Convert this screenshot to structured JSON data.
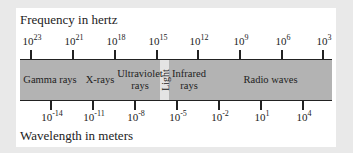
{
  "diagram": {
    "title_top": "Frequency in hertz",
    "title_bottom": "Wavelength in meters",
    "colors": {
      "band": "#b3b3b3",
      "light_strip": "#e4e4e4",
      "panel": "#ffffff",
      "background": "#e9e9e9"
    },
    "frequency_ticks": [
      {
        "base": "10",
        "exp": "23",
        "x": 30
      },
      {
        "base": "10",
        "exp": "21",
        "x": 72
      },
      {
        "base": "10",
        "exp": "18",
        "x": 114
      },
      {
        "base": "10",
        "exp": "15",
        "x": 156
      },
      {
        "base": "10",
        "exp": "12",
        "x": 197
      },
      {
        "base": "10",
        "exp": "9",
        "x": 239
      },
      {
        "base": "10",
        "exp": "6",
        "x": 281
      },
      {
        "base": "10",
        "exp": "3",
        "x": 322
      }
    ],
    "wavelength_ticks": [
      {
        "base": "10",
        "exp": "-14",
        "x": 50
      },
      {
        "base": "10",
        "exp": "-11",
        "x": 92
      },
      {
        "base": "10",
        "exp": "-8",
        "x": 134
      },
      {
        "base": "10",
        "exp": "-5",
        "x": 176
      },
      {
        "base": "10",
        "exp": "-2",
        "x": 218
      },
      {
        "base": "10",
        "exp": "1",
        "x": 260
      },
      {
        "base": "10",
        "exp": "4",
        "x": 302
      }
    ],
    "regions": [
      {
        "label": "Gamma rays",
        "left": 0,
        "width": 60
      },
      {
        "label": "X-rays",
        "left": 60,
        "width": 40
      },
      {
        "label": "Ultraviolet rays",
        "left": 100,
        "width": 40
      },
      {
        "label": "Infrared rays",
        "left": 149,
        "width": 40
      },
      {
        "label": "Radio waves",
        "left": 189,
        "width": 123
      }
    ],
    "light": {
      "label": "Light",
      "left": 140
    }
  }
}
